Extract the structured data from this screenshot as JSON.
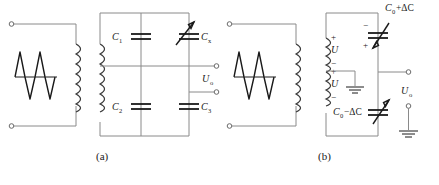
{
  "figure": {
    "type": "circuit-diagram",
    "panels": [
      {
        "id": "a",
        "caption": "(a)",
        "source": {
          "name": "ac-source",
          "waveform": "sine",
          "cycles": 2
        },
        "components": [
          {
            "ref": "C1",
            "label": "C₁",
            "kind": "capacitor",
            "position": "bridge-top-left"
          },
          {
            "ref": "C2",
            "label": "C₂",
            "kind": "capacitor",
            "position": "bridge-bottom-left"
          },
          {
            "ref": "Cx",
            "label": "Cₓ",
            "kind": "variable-capacitor",
            "position": "bridge-top-right"
          },
          {
            "ref": "C3",
            "label": "C₃",
            "kind": "capacitor",
            "position": "bridge-bottom-right"
          }
        ],
        "output": {
          "label": "Uₒ",
          "terminals": 2
        }
      },
      {
        "id": "b",
        "caption": "(b)",
        "source": {
          "name": "ac-source",
          "waveform": "sine",
          "cycles": 2
        },
        "windings": [
          {
            "ref": "W1",
            "label": "U",
            "polarity_top": "+",
            "polarity_bottom": "−"
          },
          {
            "ref": "W2",
            "label": "U",
            "polarity_top": "+",
            "polarity_bottom": "−"
          }
        ],
        "components": [
          {
            "ref": "Ctop",
            "label": "C₀+ΔC",
            "kind": "variable-capacitor",
            "position": "top",
            "polarity_top": "−",
            "polarity_bottom": "+"
          },
          {
            "ref": "Cbot",
            "label": "C₀−ΔC",
            "kind": "variable-capacitor",
            "position": "bottom"
          }
        ],
        "output": {
          "label": "Uₒ",
          "terminals": 2
        },
        "ground": {
          "count": 2,
          "name": "ground-symbol"
        }
      }
    ],
    "style": {
      "wire_color": "#8a8a8a",
      "component_color": "#1a1a1a",
      "text_color": "#1a1a1a",
      "background": "#ffffff"
    }
  }
}
